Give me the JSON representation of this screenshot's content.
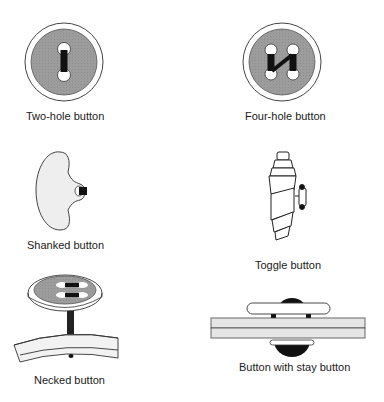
{
  "colors": {
    "button_fill": "#9a9a9a",
    "rim_fill": "#ffffff",
    "outline": "#333333",
    "thread": "#111111",
    "light_fill": "#eeeeee",
    "fabric_fill": "#e6e6e6"
  },
  "items": [
    {
      "id": "two-hole",
      "label": "Two-hole button"
    },
    {
      "id": "four-hole",
      "label": "Four-hole button"
    },
    {
      "id": "shanked",
      "label": "Shanked button"
    },
    {
      "id": "toggle",
      "label": "Toggle button"
    },
    {
      "id": "necked",
      "label": "Necked button"
    },
    {
      "id": "stay",
      "label": "Button with stay button"
    }
  ]
}
